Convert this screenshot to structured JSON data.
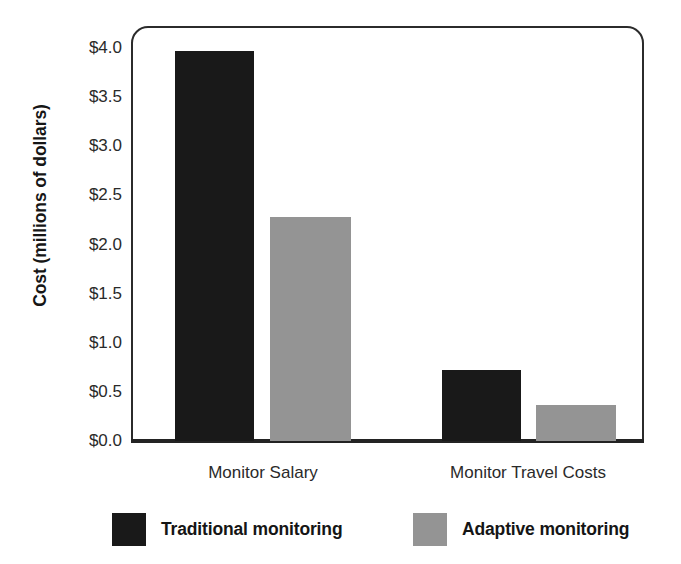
{
  "chart_data": {
    "type": "bar",
    "title": "",
    "subtitle": "",
    "xlabel": "",
    "ylabel": "Cost (millions of dollars)",
    "categories": [
      "Monitor Salary",
      "Monitor Travel Costs"
    ],
    "series": [
      {
        "name": "Traditional monitoring",
        "color": "#191919",
        "values": [
          3.97,
          0.72
        ]
      },
      {
        "name": "Adaptive monitoring",
        "color": "#949494",
        "values": [
          2.28,
          0.37
        ]
      }
    ],
    "ylim": [
      0.0,
      4.0
    ],
    "ytick_values": [
      0.0,
      0.5,
      1.0,
      1.5,
      2.0,
      2.5,
      3.0,
      3.5,
      4.0
    ],
    "ytick_labels": [
      "$0.0",
      "$0.5",
      "$1.0",
      "$1.5",
      "$2.0",
      "$2.5",
      "$3.0",
      "$3.5",
      "$4.0"
    ],
    "grid": false,
    "legend_position": "bottom"
  },
  "axis": {
    "y_title": "Cost (millions of dollars)",
    "ticks": [
      {
        "label": "$4.0",
        "value": 4.0
      },
      {
        "label": "$3.5",
        "value": 3.5
      },
      {
        "label": "$3.0",
        "value": 3.0
      },
      {
        "label": "$2.5",
        "value": 2.5
      },
      {
        "label": "$2.0",
        "value": 2.0
      },
      {
        "label": "$1.5",
        "value": 1.5
      },
      {
        "label": "$1.0",
        "value": 1.0
      },
      {
        "label": "$0.5",
        "value": 0.5
      },
      {
        "label": "$0.0",
        "value": 0.0
      }
    ]
  },
  "categories": [
    {
      "label": "Monitor Salary"
    },
    {
      "label": "Monitor Travel Costs"
    }
  ],
  "bars": [
    {
      "series": "Traditional monitoring",
      "category": "Monitor Salary",
      "value": 3.97
    },
    {
      "series": "Adaptive monitoring",
      "category": "Monitor Salary",
      "value": 2.28
    },
    {
      "series": "Traditional monitoring",
      "category": "Monitor Travel Costs",
      "value": 0.72
    },
    {
      "series": "Adaptive monitoring",
      "category": "Monitor Travel Costs",
      "value": 0.37
    }
  ],
  "legend": {
    "entries": [
      {
        "label": "Traditional monitoring",
        "color": "#191919"
      },
      {
        "label": "Adaptive monitoring",
        "color": "#949494"
      }
    ]
  }
}
